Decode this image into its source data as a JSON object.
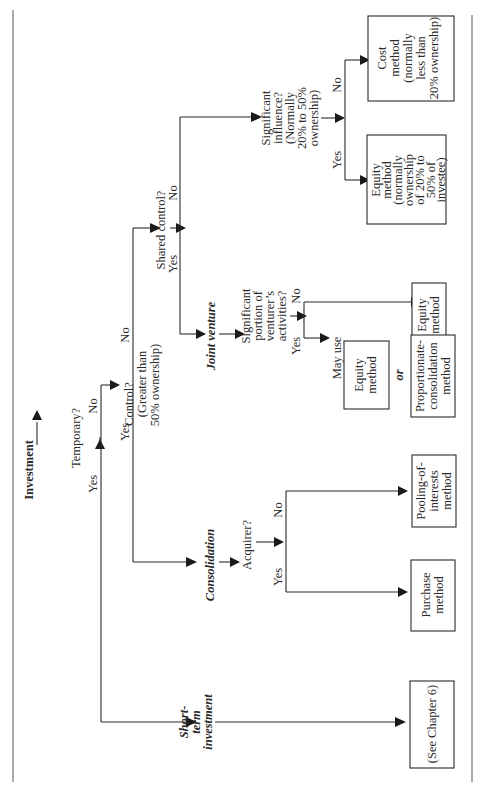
{
  "diagram": {
    "title": "Investment",
    "nodes": {
      "investment": {
        "label": "Investment"
      },
      "temporary": {
        "label": "Temporary?"
      },
      "control": {
        "lines": [
          "Control?",
          "(Greater than",
          "50% ownership)"
        ]
      },
      "shared_control": {
        "label": "Shared control?"
      },
      "significant_influence": {
        "lines": [
          "Significant",
          "influence?",
          "(Normally",
          "20% to 50%",
          "ownership)"
        ]
      },
      "joint_venture": {
        "label": "Joint venture"
      },
      "significant_portion": {
        "lines": [
          "Significant",
          "portion of",
          "venturer’s",
          "activities?"
        ]
      },
      "consolidation": {
        "label": "Consolidation"
      },
      "acquirer": {
        "label": "Acquirer?"
      },
      "short_term": {
        "lines": [
          "Short-",
          "term",
          "investment"
        ]
      },
      "may_use": {
        "label": "May use"
      },
      "or": {
        "label": "or"
      }
    },
    "boxes": {
      "cost_method": {
        "lines": [
          "Cost",
          "method",
          "(normally",
          "less than",
          "20% ownership)"
        ]
      },
      "equity_method_influence": {
        "lines": [
          "Equity",
          "method",
          "(normally",
          "ownership",
          "of 20% to",
          "50% of",
          "investee)"
        ]
      },
      "equity_method_jv_no": {
        "lines": [
          "Equity",
          "method"
        ]
      },
      "equity_method_jv_yes": {
        "lines": [
          "Equity",
          "method"
        ]
      },
      "proportionate_consolidation": {
        "lines": [
          "Proportionate-",
          "consolidation",
          "method"
        ]
      },
      "pooling_of_interests": {
        "lines": [
          "Pooling-of-",
          "interests",
          "method"
        ]
      },
      "purchase_method": {
        "lines": [
          "Purchase",
          "method"
        ]
      },
      "see_chapter": {
        "lines": [
          "(See Chapter 6)"
        ]
      }
    },
    "edge_labels": {
      "temporary_yes": "Yes",
      "temporary_no": "No",
      "control_yes": "Yes",
      "control_no": "No",
      "shared_yes": "Yes",
      "shared_no": "No",
      "influence_yes": "Yes",
      "influence_no": "No",
      "portion_yes": "Yes",
      "portion_no": "No",
      "acquirer_yes": "Yes",
      "acquirer_no": "No"
    }
  }
}
